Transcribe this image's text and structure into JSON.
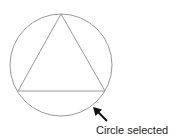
{
  "diagram": {
    "caption": "Circle selected",
    "shapes": {
      "circle": {
        "cx": 61,
        "cy": 65,
        "r": 51,
        "stroke": "#9a9a9a"
      },
      "triangle": {
        "points": [
          [
            61,
            14
          ],
          [
            18,
            91
          ],
          [
            105,
            91
          ]
        ],
        "stroke": "#9a9a9a"
      },
      "arrow": {
        "from": [
          107,
          121
        ],
        "to": [
          93,
          107
        ],
        "color": "#111111"
      }
    }
  }
}
